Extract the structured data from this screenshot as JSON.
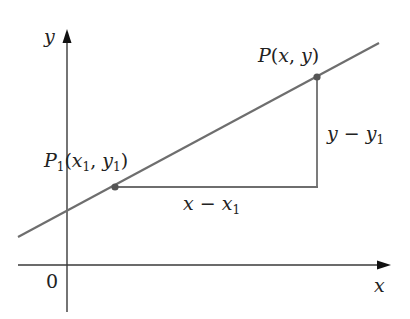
{
  "diagram": {
    "axes": {
      "x_label": "x",
      "y_label": "y",
      "origin_label": "0"
    },
    "points": [
      {
        "id": "P1",
        "label_main": "P",
        "label_sub": "1",
        "label_args_open": "(",
        "arg1": "x",
        "arg1_sub": "1",
        "sep": ", ",
        "arg2": "y",
        "arg2_sub": "1",
        "label_args_close": ")"
      },
      {
        "id": "P",
        "label_main": "P",
        "label_args_open": "(",
        "arg1": "x",
        "sep": ", ",
        "arg2": "y",
        "label_args_close": ")"
      }
    ],
    "run_label": {
      "a": "x",
      "op": " − ",
      "b": "x",
      "b_sub": "1"
    },
    "rise_label": {
      "a": "y",
      "op": " − ",
      "b": "y",
      "b_sub": "1"
    },
    "colors": {
      "line": "#6e6e6e",
      "axes": "#3a3a3a",
      "point": "#555555",
      "text": "#222222"
    }
  }
}
